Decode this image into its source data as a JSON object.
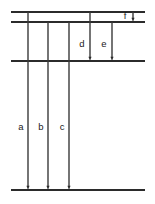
{
  "figure": {
    "type": "energy-level-transition-diagram",
    "background_color": "#ffffff",
    "line_color": "#2b2b2b",
    "label_color": "#1a1a1a",
    "width": 155,
    "height": 204
  },
  "levels": [
    {
      "id": "level-1",
      "y": 12,
      "x_start": 11,
      "x_end": 145
    },
    {
      "id": "level-2",
      "y": 22,
      "x_start": 11,
      "x_end": 145
    },
    {
      "id": "level-3",
      "y": 61,
      "x_start": 11,
      "x_end": 145
    },
    {
      "id": "level-4",
      "y": 190,
      "x_start": 11,
      "x_end": 145
    }
  ],
  "transitions": [
    {
      "label": "a",
      "x": 28,
      "y_start": 12,
      "y_end": 190,
      "label_x": 21,
      "label_y": 127
    },
    {
      "label": "b",
      "x": 48,
      "y_start": 22,
      "y_end": 190,
      "label_x": 41,
      "label_y": 127
    },
    {
      "label": "c",
      "x": 69,
      "y_start": 22,
      "y_end": 190,
      "label_x": 62,
      "label_y": 127
    },
    {
      "label": "d",
      "x": 90,
      "y_start": 12,
      "y_end": 61,
      "label_x": 82,
      "label_y": 44
    },
    {
      "label": "e",
      "x": 112,
      "y_start": 22,
      "y_end": 61,
      "label_x": 104,
      "label_y": 44
    },
    {
      "label": "f",
      "x": 133,
      "y_start": 12,
      "y_end": 22,
      "label_x": 125,
      "label_y": 16
    }
  ],
  "chart_data": {
    "type": "diagram",
    "title": "",
    "level_count": 4,
    "level_positions_y": [
      12,
      22,
      61,
      190
    ],
    "transition_labels": [
      "a",
      "b",
      "c",
      "d",
      "e",
      "f"
    ],
    "transition_from_level": [
      1,
      2,
      2,
      1,
      2,
      1
    ],
    "transition_to_level": [
      4,
      4,
      4,
      3,
      3,
      2
    ]
  }
}
